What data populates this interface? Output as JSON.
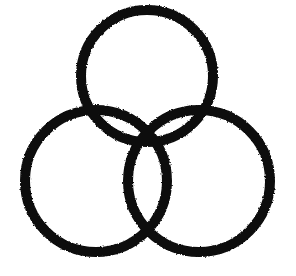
{
  "figure": {
    "title": "Three Interlocking Rings",
    "background_color": "#ffffff",
    "ink_color": "#111111",
    "canvas": {
      "width": 296,
      "height": 276
    },
    "stroke": {
      "width": 10,
      "style": "rough-ink",
      "linecap": "round"
    },
    "rings": [
      {
        "name": "top-ring",
        "label": "Top ring",
        "cx": 147,
        "cy": 76,
        "r": 66,
        "bounds": {
          "left": 81,
          "top": 10,
          "right": 213,
          "bottom": 142
        }
      },
      {
        "name": "bottom-left-ring",
        "label": "Bottom left ring",
        "cx": 96,
        "cy": 181,
        "r": 71,
        "bounds": {
          "left": 25,
          "top": 110,
          "right": 167,
          "bottom": 252
        }
      },
      {
        "name": "bottom-right-ring",
        "label": "Bottom right ring",
        "cx": 199,
        "cy": 181,
        "r": 71,
        "bounds": {
          "left": 128,
          "top": 110,
          "right": 270,
          "bottom": 252
        }
      }
    ],
    "intersections": [
      {
        "name": "upper-left-crossing",
        "x": 78,
        "y": 113
      },
      {
        "name": "upper-right-crossing",
        "x": 214,
        "y": 113
      },
      {
        "name": "lower-center-crossing",
        "x": 152,
        "y": 228
      },
      {
        "name": "center-lens-top",
        "x": 147,
        "y": 133
      }
    ]
  }
}
